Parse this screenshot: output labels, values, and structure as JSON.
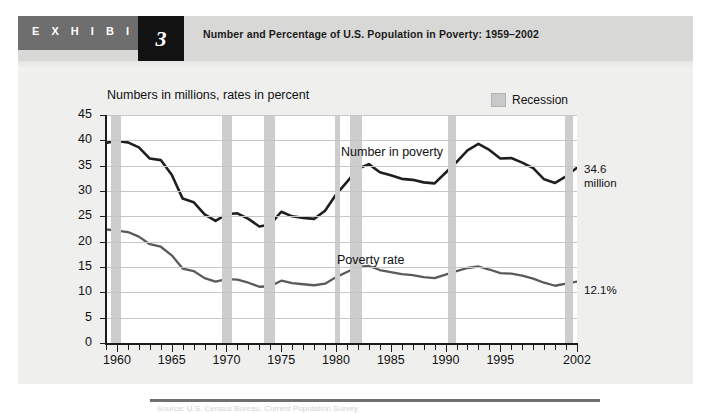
{
  "header": {
    "exhibit_word": "E X H I B I T",
    "exhibit_number": "3",
    "title": "Number and Percentage of U.S. Population in Poverty: 1959–2002"
  },
  "legend": {
    "recession_label": "Recession",
    "recession_color": "#cdcdcd"
  },
  "annotations": {
    "number_end_value": "34.6",
    "number_end_unit": "million",
    "rate_end_value": "12.1%"
  },
  "source": {
    "text": "Source: U.S. Census Bureau, Current Population Survey"
  },
  "chart_data": {
    "type": "line",
    "title": "Numbers in millions, rates in percent",
    "xlabel": "",
    "ylabel": "",
    "xlim": [
      1959,
      2002
    ],
    "ylim": [
      0,
      45
    ],
    "ytick_values": [
      0,
      5,
      10,
      15,
      20,
      25,
      30,
      35,
      40,
      45
    ],
    "ytick_labels": [
      "0",
      "5",
      "10",
      "15",
      "20",
      "25",
      "30",
      "35",
      "40",
      "45"
    ],
    "xtick_values": [
      1960,
      1965,
      1970,
      1975,
      1980,
      1985,
      1990,
      1995,
      2002
    ],
    "xtick_labels": [
      "1960",
      "1965",
      "1970",
      "1975",
      "1980",
      "1985",
      "1990",
      "1995",
      "2002"
    ],
    "grid": true,
    "grid_axis": "y",
    "legend_position": "top-right",
    "x": [
      1959,
      1960,
      1961,
      1962,
      1963,
      1964,
      1965,
      1966,
      1967,
      1968,
      1969,
      1970,
      1971,
      1972,
      1973,
      1974,
      1975,
      1976,
      1977,
      1978,
      1979,
      1980,
      1981,
      1982,
      1983,
      1984,
      1985,
      1986,
      1987,
      1988,
      1989,
      1990,
      1991,
      1992,
      1993,
      1994,
      1995,
      1996,
      1997,
      1998,
      1999,
      2000,
      2001,
      2002
    ],
    "series": [
      {
        "name": "Number in poverty",
        "label": "Number in poverty",
        "unit": "millions",
        "color": "#1f1f1f",
        "width": 2.6,
        "values": [
          39.5,
          39.9,
          39.6,
          38.6,
          36.4,
          36.1,
          33.2,
          28.5,
          27.8,
          25.4,
          24.1,
          25.4,
          25.6,
          24.5,
          23.0,
          23.4,
          25.9,
          25.0,
          24.7,
          24.5,
          26.1,
          29.3,
          31.8,
          34.4,
          35.3,
          33.7,
          33.1,
          32.4,
          32.2,
          31.7,
          31.5,
          33.6,
          35.7,
          38.0,
          39.3,
          38.1,
          36.4,
          36.5,
          35.6,
          34.5,
          32.3,
          31.6,
          32.9,
          34.6
        ]
      },
      {
        "name": "Poverty rate",
        "label": "Poverty rate",
        "unit": "percent",
        "color": "#5a5a5a",
        "width": 2.3,
        "values": [
          22.4,
          22.2,
          21.9,
          21.0,
          19.5,
          19.0,
          17.3,
          14.7,
          14.2,
          12.8,
          12.1,
          12.6,
          12.5,
          11.9,
          11.1,
          11.2,
          12.3,
          11.8,
          11.6,
          11.4,
          11.7,
          13.0,
          14.0,
          15.0,
          15.2,
          14.4,
          14.0,
          13.6,
          13.4,
          13.0,
          12.8,
          13.5,
          14.2,
          14.8,
          15.1,
          14.5,
          13.8,
          13.7,
          13.3,
          12.7,
          11.9,
          11.3,
          11.7,
          12.1
        ]
      }
    ],
    "recessions": [
      {
        "start": 1959.5,
        "end": 1960.4
      },
      {
        "start": 1969.6,
        "end": 1970.5
      },
      {
        "start": 1973.4,
        "end": 1974.4
      },
      {
        "start": 1979.9,
        "end": 1980.4
      },
      {
        "start": 1981.3,
        "end": 1982.4
      },
      {
        "start": 1990.2,
        "end": 1991.0
      },
      {
        "start": 2000.9,
        "end": 2001.6
      }
    ]
  }
}
